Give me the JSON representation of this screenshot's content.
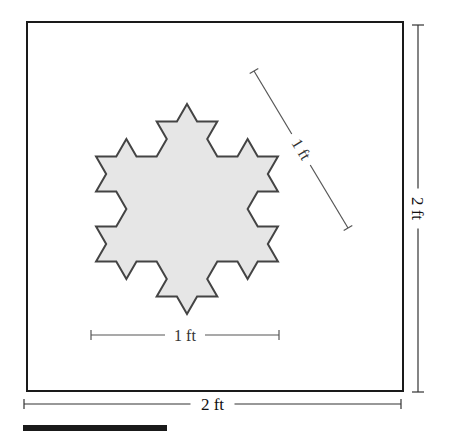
{
  "figure": {
    "square": {
      "x": 27,
      "y": 22,
      "width": 376,
      "height": 369,
      "stroke": "#1a1a1a",
      "stroke_width": 2
    },
    "snowflake": {
      "center_x": 187,
      "center_y": 209,
      "radius": 105,
      "iterations": 2,
      "fill": "#e6e6e6",
      "stroke": "#444444",
      "stroke_width": 2
    },
    "dimensions": {
      "horizontal_small": {
        "label": "1 ft",
        "x1": 91,
        "x2": 279,
        "y": 335
      },
      "diagonal": {
        "label": "1 ft",
        "x1": 254,
        "y1": 71,
        "x2": 348,
        "y2": 228
      },
      "vertical_big": {
        "label": "2 ft",
        "x": 418,
        "y1": 25,
        "y2": 392
      },
      "horizontal_big": {
        "label": "2 ft",
        "x1": 24,
        "x2": 401,
        "y": 404
      }
    },
    "black_bar": {
      "x": 23,
      "y": 425,
      "width": 144,
      "height": 6,
      "color": "#1a1a1a"
    }
  }
}
